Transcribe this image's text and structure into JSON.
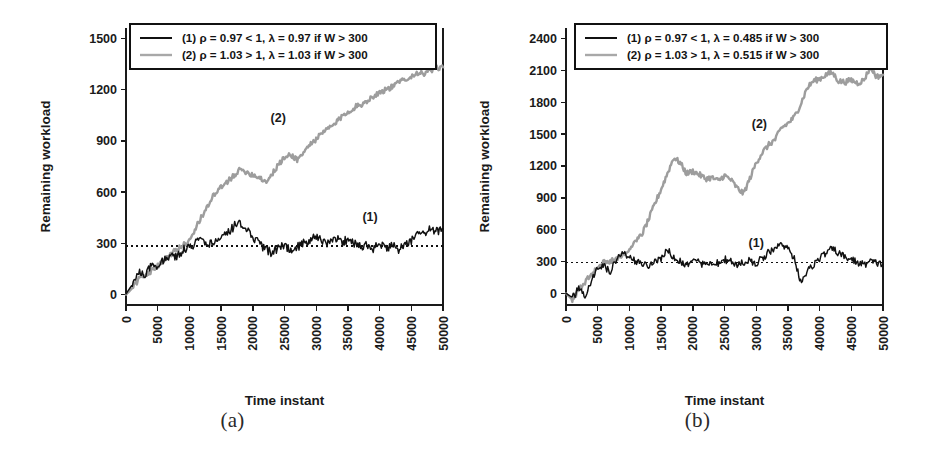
{
  "figure": {
    "panels": [
      {
        "caption": "(a)",
        "ylabel": "Remaining workload",
        "xlabel": "Time instant",
        "legend": [
          {
            "key": "series-1",
            "text": "(1)  ρ = 0.97 < 1, λ = 0.97 if W > 300"
          },
          {
            "key": "series-2",
            "text": "(2)  ρ = 1.03 > 1, λ = 1.03 if W > 300"
          }
        ],
        "annotations": [
          {
            "text": "(2)",
            "x": 24000,
            "y": 1010
          },
          {
            "text": "(1)",
            "x": 38500,
            "y": 430
          }
        ]
      },
      {
        "caption": "(b)",
        "ylabel": "Remaining workload",
        "xlabel": "Time instant",
        "legend": [
          {
            "key": "series-1",
            "text": "(1)  ρ = 0.97 < 1, λ = 0.485 if W > 300"
          },
          {
            "key": "series-2",
            "text": "(2)  ρ = 1.03 > 1, λ = 0.515 if W > 300"
          }
        ],
        "annotations": [
          {
            "text": "(2)",
            "x": 30500,
            "y": 1560
          },
          {
            "text": "(1)",
            "x": 30000,
            "y": 440
          }
        ]
      }
    ]
  },
  "chart_data": [
    {
      "type": "line",
      "title": "(a)",
      "xlabel": "Time instant",
      "ylabel": "Remaining workload",
      "xlim": [
        0,
        50000
      ],
      "ylim": [
        -60,
        1560
      ],
      "xticks": [
        0,
        5000,
        10000,
        15000,
        20000,
        25000,
        30000,
        35000,
        40000,
        45000,
        50000
      ],
      "xticklabels": [
        "0",
        "5000",
        "10000",
        "15000",
        "20000",
        "25000",
        "30000",
        "35000",
        "40000",
        "45000",
        "50000"
      ],
      "yticks": [
        0,
        300,
        600,
        900,
        1200,
        1500
      ],
      "yticklabels": [
        "0",
        "300",
        "600",
        "900",
        "1200",
        "1500"
      ],
      "grid": false,
      "legend_position": "top",
      "threshold_line": {
        "y": 285,
        "style": "dotted",
        "label": "W = 300"
      },
      "colors": {
        "series_1": "#111111",
        "series_2": "#9d9d9d"
      },
      "series": [
        {
          "name": "(1) ρ = 0.97 < 1, λ = 0.97 if W > 300",
          "color": "#111111",
          "x": [
            0,
            1000,
            2000,
            3000,
            4000,
            5000,
            6000,
            7000,
            8000,
            9000,
            10000,
            11000,
            12000,
            13000,
            14000,
            15000,
            16000,
            17000,
            18000,
            19000,
            20000,
            21000,
            22000,
            23000,
            24000,
            25000,
            26000,
            27000,
            28000,
            29000,
            30000,
            31000,
            32000,
            33000,
            34000,
            35000,
            36000,
            37000,
            38000,
            39000,
            40000,
            41000,
            42000,
            43000,
            44000,
            45000,
            46000,
            47000,
            48000,
            49000,
            50000
          ],
          "y": [
            5,
            60,
            130,
            120,
            165,
            175,
            200,
            240,
            215,
            265,
            285,
            300,
            320,
            290,
            310,
            330,
            355,
            400,
            420,
            380,
            330,
            300,
            265,
            245,
            275,
            290,
            255,
            280,
            300,
            320,
            345,
            320,
            300,
            330,
            305,
            325,
            300,
            280,
            300,
            270,
            290,
            275,
            290,
            265,
            285,
            320,
            380,
            350,
            390,
            370,
            385
          ]
        },
        {
          "name": "(2) ρ = 1.03 > 1, λ = 1.03 if W > 300",
          "color": "#9d9d9d",
          "x": [
            0,
            1000,
            2000,
            3000,
            4000,
            5000,
            6000,
            7000,
            8000,
            9000,
            10000,
            11000,
            12000,
            13000,
            14000,
            15000,
            16000,
            17000,
            18000,
            19000,
            20000,
            21000,
            22000,
            23000,
            24000,
            25000,
            26000,
            27000,
            28000,
            29000,
            30000,
            31000,
            32000,
            33000,
            34000,
            35000,
            36000,
            37000,
            38000,
            39000,
            40000,
            41000,
            42000,
            43000,
            44000,
            45000,
            46000,
            47000,
            48000,
            49000,
            50000
          ],
          "y": [
            0,
            40,
            90,
            110,
            140,
            170,
            200,
            235,
            265,
            290,
            320,
            390,
            460,
            530,
            590,
            625,
            660,
            700,
            730,
            720,
            700,
            690,
            660,
            700,
            760,
            800,
            820,
            790,
            830,
            880,
            910,
            945,
            975,
            1000,
            1040,
            1070,
            1095,
            1110,
            1135,
            1160,
            1185,
            1200,
            1215,
            1240,
            1265,
            1275,
            1300,
            1290,
            1310,
            1325,
            1330
          ]
        }
      ]
    },
    {
      "type": "line",
      "title": "(b)",
      "xlabel": "Time instant",
      "ylabel": "Remaining workload",
      "xlim": [
        0,
        50000
      ],
      "ylim": [
        -110,
        2500
      ],
      "xticks": [
        0,
        5000,
        10000,
        15000,
        20000,
        25000,
        30000,
        35000,
        40000,
        45000,
        50000
      ],
      "xticklabels": [
        "0",
        "5000",
        "10000",
        "15000",
        "20000",
        "25000",
        "30000",
        "35000",
        "40000",
        "45000",
        "50000"
      ],
      "yticks": [
        0,
        300,
        600,
        900,
        1200,
        1500,
        1800,
        2100,
        2400
      ],
      "yticklabels": [
        "0",
        "300",
        "600",
        "900",
        "1200",
        "1500",
        "1800",
        "2100",
        "2400"
      ],
      "grid": false,
      "legend_position": "top",
      "threshold_line": {
        "y": 290,
        "style": "dotted",
        "label": "W = 300"
      },
      "colors": {
        "series_1": "#111111",
        "series_2": "#9d9d9d"
      },
      "series": [
        {
          "name": "(1) ρ = 0.97 < 1, λ = 0.485 if W > 300",
          "color": "#111111",
          "x": [
            0,
            1000,
            2000,
            3000,
            4000,
            5000,
            6000,
            7000,
            8000,
            9000,
            10000,
            11000,
            12000,
            13000,
            14000,
            15000,
            16000,
            17000,
            18000,
            19000,
            20000,
            21000,
            22000,
            23000,
            24000,
            25000,
            26000,
            27000,
            28000,
            29000,
            30000,
            31000,
            32000,
            33000,
            34000,
            35000,
            36000,
            37000,
            38000,
            39000,
            40000,
            41000,
            42000,
            43000,
            44000,
            45000,
            46000,
            47000,
            48000,
            49000,
            50000
          ],
          "y": [
            0,
            -40,
            40,
            -30,
            120,
            230,
            250,
            200,
            330,
            390,
            330,
            300,
            290,
            260,
            300,
            330,
            420,
            330,
            300,
            275,
            310,
            290,
            265,
            300,
            280,
            320,
            300,
            270,
            290,
            310,
            285,
            330,
            390,
            430,
            470,
            420,
            330,
            115,
            200,
            270,
            330,
            380,
            420,
            380,
            340,
            320,
            290,
            270,
            300,
            285,
            275
          ]
        },
        {
          "name": "(2) ρ = 1.03 > 1, λ = 0.515 if W > 300",
          "color": "#9d9d9d",
          "x": [
            0,
            1000,
            2000,
            3000,
            4000,
            5000,
            6000,
            7000,
            8000,
            9000,
            10000,
            11000,
            12000,
            13000,
            14000,
            15000,
            16000,
            17000,
            18000,
            19000,
            20000,
            21000,
            22000,
            23000,
            24000,
            25000,
            26000,
            27000,
            28000,
            29000,
            30000,
            31000,
            32000,
            33000,
            34000,
            35000,
            36000,
            37000,
            38000,
            39000,
            40000,
            41000,
            42000,
            43000,
            44000,
            45000,
            46000,
            47000,
            48000,
            49000,
            50000
          ],
          "y": [
            0,
            -60,
            30,
            100,
            180,
            250,
            290,
            310,
            330,
            370,
            420,
            480,
            560,
            690,
            840,
            980,
            1130,
            1280,
            1230,
            1130,
            1150,
            1120,
            1080,
            1090,
            1060,
            1110,
            1070,
            990,
            940,
            1080,
            1230,
            1330,
            1400,
            1450,
            1560,
            1600,
            1660,
            1780,
            1930,
            2000,
            2020,
            2060,
            2080,
            2000,
            1990,
            2010,
            1980,
            2010,
            2130,
            2040,
            2060
          ]
        }
      ]
    }
  ]
}
